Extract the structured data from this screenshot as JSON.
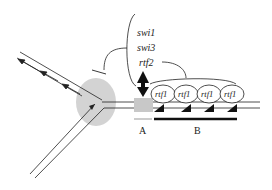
{
  "labels": {
    "factors": [
      "swi1",
      "swi3",
      "rtf2"
    ],
    "bound_protein": "rtf1",
    "region_a": "A",
    "region_b": "B"
  },
  "ovals": [
    {
      "label": "rtf1"
    },
    {
      "label": "rtf1"
    },
    {
      "label": "rtf1"
    },
    {
      "label": "rtf1"
    }
  ],
  "colors": {
    "line": "#222222",
    "replisome": "#d0d0d0",
    "site_a_box": "#c8c8c8",
    "region_bar": "#111111"
  }
}
